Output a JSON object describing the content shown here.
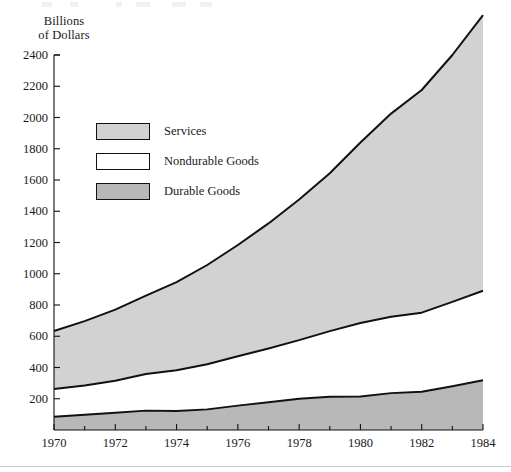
{
  "chart_data": {
    "type": "area",
    "stacked": true,
    "title": "",
    "subtitle": "",
    "xlabel": "",
    "ylabel": "Billions\nof Dollars",
    "x": [
      1970,
      1971,
      1972,
      1973,
      1974,
      1975,
      1976,
      1977,
      1978,
      1979,
      1980,
      1981,
      1982,
      1983,
      1984
    ],
    "xlim": [
      1970,
      1984
    ],
    "ylim": [
      0,
      2400
    ],
    "xtick_labels": [
      "1970",
      "1972",
      "1974",
      "1976",
      "1978",
      "1980",
      "1982",
      "1984"
    ],
    "xticks": [
      1970,
      1972,
      1974,
      1976,
      1978,
      1980,
      1982,
      1984
    ],
    "xminor_step": 1,
    "ytick_labels": [
      "200",
      "400",
      "600",
      "800",
      "1000",
      "1200",
      "1400",
      "1600",
      "1800",
      "2000",
      "2200",
      "2400"
    ],
    "yticks": [
      200,
      400,
      600,
      800,
      1000,
      1200,
      1400,
      1600,
      1800,
      2000,
      2200,
      2400
    ],
    "grid": false,
    "legend_position": "inside-upper-left",
    "series": [
      {
        "name": "Durable Goods",
        "color": "#b8b8b8",
        "values": [
          85,
          97,
          111,
          124,
          122,
          132,
          156,
          178,
          200,
          213,
          214,
          236,
          245,
          280,
          318
        ]
      },
      {
        "name": "Nondurable Goods",
        "color": "#ffffff",
        "values": [
          177,
          188,
          204,
          234,
          261,
          289,
          316,
          344,
          375,
          420,
          471,
          489,
          506,
          540,
          573
        ]
      },
      {
        "name": "Services",
        "color": "#d2d2d2",
        "values": [
          372,
          412,
          455,
          502,
          563,
          635,
          712,
          800,
          900,
          1010,
          1155,
          1300,
          1425,
          1580,
          1764
        ]
      }
    ],
    "cumulative_totals": [
      634,
      697,
      770,
      860,
      946,
      1056,
      1184,
      1322,
      1475,
      1643,
      1840,
      2025,
      2176,
      2400,
      2655
    ],
    "stacked_boundaries": {
      "durable_top": [
        85,
        97,
        111,
        124,
        122,
        132,
        156,
        178,
        200,
        213,
        214,
        236,
        245,
        280,
        318
      ],
      "nondurable_top": [
        262,
        285,
        315,
        358,
        383,
        421,
        472,
        522,
        575,
        633,
        685,
        725,
        751,
        820,
        891
      ],
      "services_top": [
        634,
        697,
        770,
        860,
        946,
        1056,
        1184,
        1322,
        1475,
        1643,
        1840,
        2025,
        2176,
        2400,
        2655
      ]
    },
    "legend": [
      {
        "label": "Services",
        "swatch": "#d2d2d2"
      },
      {
        "label": "Nondurable Goods",
        "swatch": "#ffffff"
      },
      {
        "label": "Durable Goods",
        "swatch": "#b8b8b8"
      }
    ],
    "axis_color": "#111111",
    "line_color": "#111111"
  }
}
